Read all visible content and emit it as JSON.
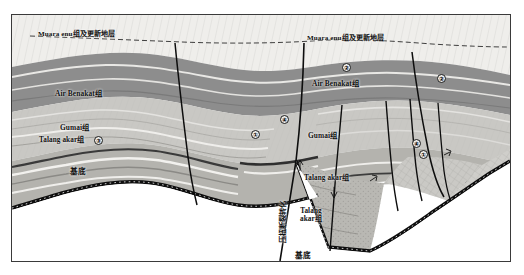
{
  "figure": {
    "kind": "geological-cross-section",
    "frame_border_color": "#3a3a3a",
    "background_color": "#ffffff"
  },
  "palette": {
    "quaternary_fill": "#efeeeb",
    "air_benakat_fill": "#8d8d8d",
    "air_benakat_dark": "#7a7a7a",
    "gumai_fill": "#c9c8c4",
    "gumai_light": "#dcdbd7",
    "talang_akar_fill": "#b4b3ae",
    "talang_akar_light": "#e6e5e1",
    "basement_fill": "#ffffff",
    "basement_line": "#111111",
    "fault_line": "#0d0d0d",
    "unconformity_dash": "#2b2b2b",
    "marker_fill": "#f2f2f0"
  },
  "labels": {
    "quaternary_left": "Muara enu组及更新地层",
    "quaternary_right": "Muara enu组及更新地层",
    "air_benakat_left": "Air Benakat组",
    "air_benakat_right": "Air Benakat组",
    "gumai_left": "Gumai组",
    "gumai_right": "Gumai组",
    "talang_akar_left": "Talang akar组",
    "talang_akar_right_upper": "Talang akar组",
    "talang_akar_right_lower_line1": "Talang",
    "talang_akar_right_lower_line2": "akar组",
    "basement_left": "基底",
    "basement_right": "基底",
    "fault_annotation_vertical": "压扭断裂转化"
  },
  "markers": [
    {
      "id": "marker-3-left",
      "symbol": "③",
      "x": 92,
      "y": 125
    },
    {
      "id": "marker-4-center",
      "symbol": "④",
      "x": 277,
      "y": 104
    },
    {
      "id": "marker-1-center",
      "symbol": "①",
      "x": 248,
      "y": 119
    },
    {
      "id": "marker-2-right-inner",
      "symbol": "②",
      "x": 339,
      "y": 52
    },
    {
      "id": "marker-2-right-outer",
      "symbol": "②",
      "x": 434,
      "y": 63
    },
    {
      "id": "marker-4-right",
      "symbol": "④",
      "x": 409,
      "y": 128
    },
    {
      "id": "marker-1-right",
      "symbol": "①",
      "x": 416,
      "y": 139
    }
  ]
}
